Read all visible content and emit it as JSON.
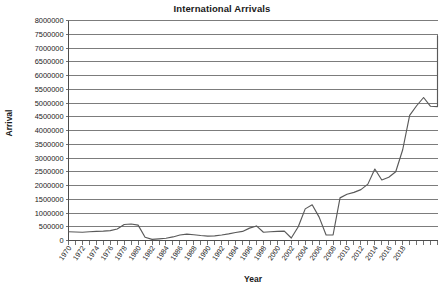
{
  "chart_data": {
    "type": "line",
    "title": "International Arrivals",
    "xlabel": "Year",
    "ylabel": "Arrival",
    "grid": "horizontal",
    "legend": "none",
    "line_color": "#595959",
    "xlim": [
      1970,
      2023
    ],
    "ylim": [
      0,
      8000000
    ],
    "ytick_step": 500000,
    "xtick_step": 2,
    "ytick_labels": [
      "8000000",
      "7500000",
      "7000000",
      "6500000",
      "6000000",
      "5500000",
      "5000000",
      "4500000",
      "4000000",
      "3500000",
      "3000000",
      "2500000",
      "2000000",
      "1500000",
      "1000000",
      "500000",
      "0"
    ],
    "ytick_values": [
      8000000,
      7500000,
      7000000,
      6500000,
      6000000,
      5500000,
      5000000,
      4500000,
      4000000,
      3500000,
      3000000,
      2500000,
      2000000,
      1500000,
      1000000,
      500000,
      0
    ],
    "xtick_labels": [
      "1970",
      "1972",
      "1974",
      "1976",
      "1978",
      "1980",
      "1982",
      "1984",
      "1986",
      "1988",
      "1990",
      "1992",
      "1994",
      "1996",
      "1998",
      "2000",
      "2002",
      "2004",
      "2006",
      "2008",
      "2010",
      "2012",
      "2014",
      "2016",
      "2018"
    ],
    "x": [
      1970,
      1971,
      1972,
      1973,
      1974,
      1975,
      1976,
      1977,
      1978,
      1979,
      1980,
      1981,
      1982,
      1983,
      1984,
      1985,
      1986,
      1987,
      1988,
      1989,
      1990,
      1991,
      1992,
      1993,
      1994,
      1995,
      1996,
      1997,
      1998,
      1999,
      2000,
      2001,
      2002,
      2003,
      2004,
      2005,
      2006,
      2007,
      2008,
      2009,
      2010,
      2011,
      2012,
      2013,
      2014,
      2015,
      2016,
      2017,
      2018,
      2019,
      2020,
      2021,
      2022,
      2023
    ],
    "values": [
      320000,
      310000,
      300000,
      320000,
      330000,
      340000,
      360000,
      420000,
      580000,
      600000,
      560000,
      120000,
      40000,
      60000,
      80000,
      130000,
      200000,
      230000,
      210000,
      180000,
      160000,
      170000,
      200000,
      240000,
      290000,
      330000,
      450000,
      530000,
      300000,
      320000,
      330000,
      340000,
      90000,
      500000,
      1150000,
      1300000,
      850000,
      200000,
      200000,
      1550000,
      1680000,
      1750000,
      1850000,
      2050000,
      2600000,
      2200000,
      2300000,
      2500000,
      3300000,
      4550000,
      4900000,
      5200000,
      4880000,
      4870000
    ],
    "series_name": "Arrival",
    "final_value": 7450000
  }
}
